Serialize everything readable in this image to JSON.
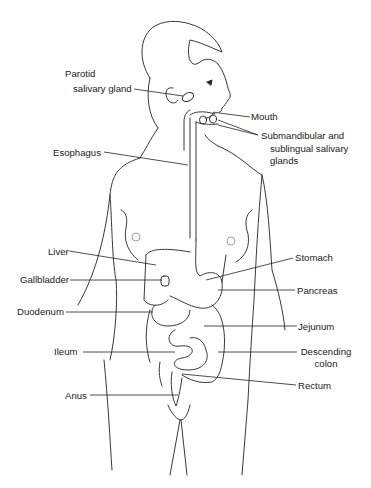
{
  "diagram": {
    "labels": {
      "parotid_line1": "Parotid",
      "parotid_line2": "salivary gland",
      "mouth": "Mouth",
      "submandibular_line1": "Submandibular and",
      "submandibular_line2": "sublingual salivary",
      "submandibular_line3": "glands",
      "esophagus": "Esophagus",
      "liver": "Liver",
      "stomach": "Stomach",
      "gallbladder": "Gallbladder",
      "pancreas": "Pancreas",
      "duodenum": "Duodenum",
      "jejunum": "Jejunum",
      "ileum": "Ileum",
      "descending_colon_line1": "Descending",
      "descending_colon_line2": "colon",
      "rectum": "Rectum",
      "anus": "Anus"
    }
  }
}
